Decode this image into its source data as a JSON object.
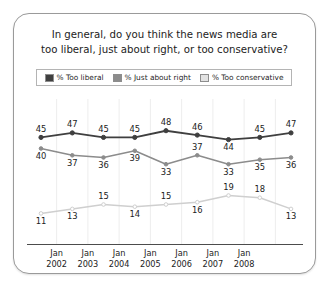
{
  "card": {
    "title_line1": "In general, do you think the news media are",
    "title_line2": "too liberal, just about right, or too conservative?"
  },
  "legend": {
    "items": [
      {
        "label": "% Too liberal",
        "color": "#3f3f3f",
        "icon": "legend-swatch-icon"
      },
      {
        "label": "% Just about right",
        "color": "#8c8c8c",
        "icon": "legend-swatch-icon"
      },
      {
        "label": "% Too conservative",
        "color": "#e2e2e2",
        "icon": "legend-swatch-icon"
      }
    ]
  },
  "chart_data": {
    "type": "line",
    "title": "In general, do you think the news media are too liberal, just about right, or too conservative?",
    "xlabel": "",
    "ylabel": "",
    "ylim": [
      0,
      55
    ],
    "grid": "vertical",
    "legend_position": "top",
    "x": [
      "Jan 2002",
      "",
      "Jan 2003",
      "Jan 2004",
      "Jan 2005",
      "Jan 2006",
      "Jan 2007",
      "Jan 2008",
      ""
    ],
    "tick_labels": [
      {
        "month": "Jan",
        "year": "2002"
      },
      {
        "month": "Jan",
        "year": "2003"
      },
      {
        "month": "Jan",
        "year": "2004"
      },
      {
        "month": "Jan",
        "year": "2005"
      },
      {
        "month": "Jan",
        "year": "2006"
      },
      {
        "month": "Jan",
        "year": "2007"
      },
      {
        "month": "Jan",
        "year": "2008"
      }
    ],
    "series": [
      {
        "name": "% Too liberal",
        "color": "#3f3f3f",
        "values": [
          45,
          47,
          45,
          45,
          48,
          46,
          44,
          45,
          47
        ],
        "label_positions": [
          "above",
          "above",
          "above",
          "above",
          "above",
          "above",
          "below",
          "above",
          "above"
        ]
      },
      {
        "name": "% Just about right",
        "color": "#8c8c8c",
        "values": [
          40,
          37,
          36,
          39,
          33,
          37,
          33,
          35,
          36
        ],
        "label_positions": [
          "below",
          "below",
          "below",
          "below",
          "below",
          "above",
          "below",
          "below",
          "below"
        ]
      },
      {
        "name": "% Too conservative",
        "color": "#cfcfcf",
        "values": [
          11,
          13,
          15,
          14,
          15,
          16,
          19,
          18,
          13
        ],
        "label_positions": [
          "below",
          "below",
          "above",
          "below",
          "above",
          "below",
          "above",
          "above",
          "below"
        ]
      }
    ]
  }
}
